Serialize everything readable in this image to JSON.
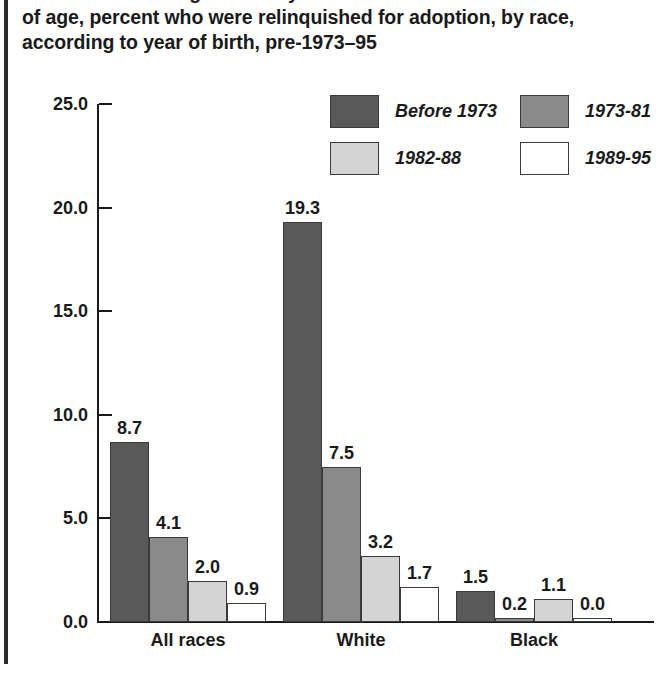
{
  "page": {
    "title_lines": [
      "Births to women aged 15–44 years who were not married at the time",
      "of age, percent who were relinquished for adoption, by race,",
      "according to year of birth, pre-1973–95"
    ]
  },
  "colors": {
    "before_1973": "#595959",
    "s1973_81": "#8a8a8a",
    "s1982_88": "#d4d4d4",
    "s1989_95": "#ffffff",
    "axis": "#1a1a1a",
    "bar_outline": "#3a3a3a",
    "page_rule": "#2b2b2b"
  },
  "legend": {
    "entries": [
      {
        "label": "Before 1973",
        "color": "#595959"
      },
      {
        "label": "1973-81",
        "color": "#8a8a8a"
      },
      {
        "label": "1982-88",
        "color": "#d4d4d4"
      },
      {
        "label": "1989-95",
        "color": "#ffffff"
      }
    ]
  },
  "axis": {
    "y_ticks": [
      "0.0",
      "5.0",
      "10.0",
      "15.0",
      "20.0",
      "25.0"
    ]
  },
  "chart_data": {
    "type": "bar",
    "title": "Births to women aged 15–44 years who were not married at the time of age, percent who were relinquished for adoption, by race, according to year of birth, pre-1973–95",
    "xlabel": "",
    "ylabel": "",
    "ylim": [
      0,
      25
    ],
    "ytick_values": [
      0,
      5,
      10,
      15,
      20,
      25
    ],
    "grid": false,
    "legend_position": "top-right",
    "categories": [
      "All races",
      "White",
      "Black"
    ],
    "series": [
      {
        "name": "Before 1973",
        "color": "#595959",
        "values": [
          8.7,
          19.3,
          1.5
        ],
        "labels": [
          "8.7",
          "19.3",
          "1.5"
        ]
      },
      {
        "name": "1973-81",
        "color": "#8a8a8a",
        "values": [
          4.1,
          7.5,
          0.2
        ],
        "labels": [
          "4.1",
          "7.5",
          "0.2"
        ]
      },
      {
        "name": "1982-88",
        "color": "#d4d4d4",
        "values": [
          2.0,
          3.2,
          1.1
        ],
        "labels": [
          "2.0",
          "3.2",
          "1.1"
        ]
      },
      {
        "name": "1989-95",
        "color": "#ffffff",
        "values": [
          0.9,
          1.7,
          0.0
        ],
        "labels": [
          "0.9",
          "1.7",
          "0.0"
        ]
      }
    ]
  },
  "layout": {
    "group_left_px": [
      110,
      283,
      456
    ],
    "bar_width_px": 39,
    "plot_bottom_px": 622,
    "plot_top_px": 104,
    "px_per_unit": 20.72
  }
}
